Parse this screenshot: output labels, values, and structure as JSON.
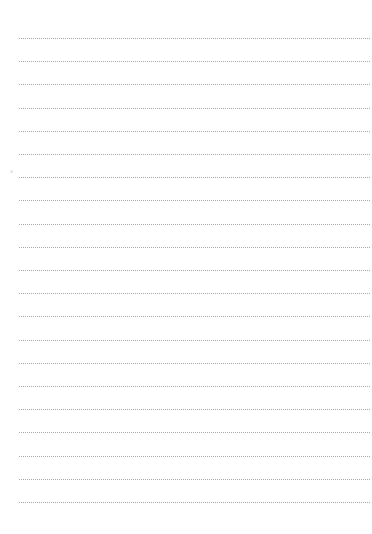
{
  "page": {
    "type": "lined-paper",
    "background_color": "#ffffff",
    "line_color": "#a8a8a8",
    "line_style": "dotted",
    "line_count": 21,
    "first_line_y": 38,
    "line_spacing": 23.2,
    "line_left": 19,
    "line_right": 370
  }
}
